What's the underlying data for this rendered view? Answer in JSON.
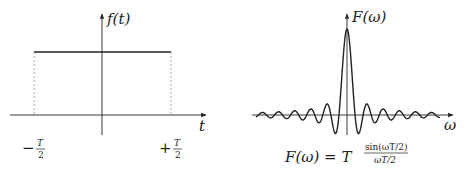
{
  "left_panel": {
    "y_axis_label": "f(t)",
    "x_axis_label": "t",
    "left_tick": {
      "sign": "−",
      "num": "T",
      "den": "2"
    },
    "right_tick": {
      "sign": "+",
      "num": "T",
      "den": "2"
    }
  },
  "right_panel": {
    "y_axis_label": "F(ω)",
    "x_axis_label": "ω",
    "formula": {
      "lhs": "F(ω) = T",
      "num": "sin(ωT/2)",
      "den": "ωT/2"
    }
  },
  "colors": {
    "ink": "#222222",
    "dashed": "#999999",
    "background": "#ffffff"
  }
}
